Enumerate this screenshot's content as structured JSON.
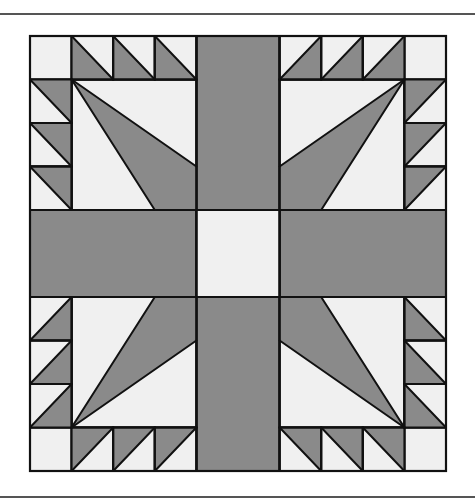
{
  "figure": {
    "title": "",
    "colors": {
      "dark": "#8a8a8a",
      "light": "#f0f0f0",
      "stroke": "#111111",
      "rule": "#555555"
    },
    "grid": {
      "x0": 30,
      "y0": 36,
      "x1": 446,
      "y1": 471,
      "divisions": 10
    },
    "rules": [
      {
        "name": "top-rule",
        "y": 13
      },
      {
        "name": "bottom-rule",
        "y": 496
      }
    ],
    "pieces": {
      "sashing": [
        {
          "name": "sash-top",
          "cells": [
            4,
            0,
            6,
            4
          ],
          "fill": "dark"
        },
        {
          "name": "sash-bottom",
          "cells": [
            4,
            6,
            6,
            10
          ],
          "fill": "dark"
        },
        {
          "name": "sash-left",
          "cells": [
            0,
            4,
            4,
            6
          ],
          "fill": "dark"
        },
        {
          "name": "sash-right",
          "cells": [
            6,
            4,
            10,
            6
          ],
          "fill": "dark"
        },
        {
          "name": "center-square",
          "cells": [
            4,
            4,
            6,
            6
          ],
          "fill": "light"
        }
      ],
      "corner_squares": [
        {
          "name": "corner-tl",
          "cells": [
            0,
            0,
            1,
            1
          ]
        },
        {
          "name": "corner-tr",
          "cells": [
            9,
            0,
            10,
            1
          ]
        },
        {
          "name": "corner-bl",
          "cells": [
            0,
            9,
            1,
            10
          ]
        },
        {
          "name": "corner-br",
          "cells": [
            9,
            9,
            10,
            10
          ]
        }
      ],
      "quadrants": [
        {
          "name": "quadrant-top-left",
          "square": [
            1,
            1,
            4,
            4
          ],
          "kite": [
            [
              1,
              1
            ],
            [
              4,
              3
            ],
            [
              4,
              4
            ],
            [
              3,
              4
            ]
          ],
          "kite_lines": [
            [
              [
                1,
                1
              ],
              [
                4,
                3
              ]
            ],
            [
              [
                1,
                1
              ],
              [
                3,
                4
              ]
            ]
          ],
          "saw_top": {
            "cells": [
              [
                1,
                0
              ],
              [
                2,
                0
              ],
              [
                3,
                0
              ]
            ],
            "tri": [
              "tl",
              "bl",
              "br"
            ],
            "diag": [
              "tl",
              "br"
            ]
          },
          "saw_side": {
            "cells": [
              [
                0,
                1
              ],
              [
                0,
                2
              ],
              [
                0,
                3
              ]
            ],
            "tri": [
              "tl",
              "tr",
              "br"
            ],
            "diag": [
              "tl",
              "br"
            ]
          }
        },
        {
          "name": "quadrant-top-right",
          "square": [
            6,
            1,
            9,
            4
          ],
          "kite": [
            [
              9,
              1
            ],
            [
              6,
              3
            ],
            [
              6,
              4
            ],
            [
              7,
              4
            ]
          ],
          "kite_lines": [
            [
              [
                9,
                1
              ],
              [
                6,
                3
              ]
            ],
            [
              [
                9,
                1
              ],
              [
                7,
                4
              ]
            ]
          ],
          "saw_top": {
            "cells": [
              [
                6,
                0
              ],
              [
                7,
                0
              ],
              [
                8,
                0
              ]
            ],
            "tri": [
              "bl",
              "br",
              "tr"
            ],
            "diag": [
              "bl",
              "tr"
            ]
          },
          "saw_side": {
            "cells": [
              [
                9,
                1
              ],
              [
                9,
                2
              ],
              [
                9,
                3
              ]
            ],
            "tri": [
              "tl",
              "tr",
              "bl"
            ],
            "diag": [
              "bl",
              "tr"
            ]
          }
        },
        {
          "name": "quadrant-bottom-left",
          "square": [
            1,
            6,
            4,
            9
          ],
          "kite": [
            [
              1,
              9
            ],
            [
              4,
              7
            ],
            [
              4,
              6
            ],
            [
              3,
              6
            ]
          ],
          "kite_lines": [
            [
              [
                1,
                9
              ],
              [
                4,
                7
              ]
            ],
            [
              [
                1,
                9
              ],
              [
                3,
                6
              ]
            ]
          ],
          "saw_top": {
            "cells": [
              [
                1,
                9
              ],
              [
                2,
                9
              ],
              [
                3,
                9
              ]
            ],
            "tri": [
              "tl",
              "tr",
              "bl"
            ],
            "diag": [
              "bl",
              "tr"
            ]
          },
          "saw_side": {
            "cells": [
              [
                0,
                6
              ],
              [
                0,
                7
              ],
              [
                0,
                8
              ]
            ],
            "tri": [
              "bl",
              "br",
              "tr"
            ],
            "diag": [
              "bl",
              "tr"
            ]
          }
        },
        {
          "name": "quadrant-bottom-right",
          "square": [
            6,
            6,
            9,
            9
          ],
          "kite": [
            [
              9,
              9
            ],
            [
              6,
              7
            ],
            [
              6,
              6
            ],
            [
              7,
              6
            ]
          ],
          "kite_lines": [
            [
              [
                9,
                9
              ],
              [
                6,
                7
              ]
            ],
            [
              [
                9,
                9
              ],
              [
                7,
                6
              ]
            ]
          ],
          "saw_top": {
            "cells": [
              [
                6,
                9
              ],
              [
                7,
                9
              ],
              [
                8,
                9
              ]
            ],
            "tri": [
              "tl",
              "tr",
              "br"
            ],
            "diag": [
              "tl",
              "br"
            ]
          },
          "saw_side": {
            "cells": [
              [
                9,
                6
              ],
              [
                9,
                7
              ],
              [
                9,
                8
              ]
            ],
            "tri": [
              "tl",
              "bl",
              "br"
            ],
            "diag": [
              "tl",
              "br"
            ]
          }
        }
      ]
    }
  }
}
